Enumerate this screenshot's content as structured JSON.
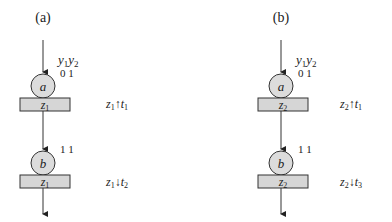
{
  "panels": [
    {
      "label": "(a)",
      "inputs": {
        "header_y1": "y",
        "header_sub1": "1",
        "header_y2": "y",
        "header_sub2": "2",
        "values_top": "0 1",
        "values_bottom": "1 1"
      },
      "nodes": [
        {
          "circle": "a",
          "box_var": "z",
          "box_sub": "1",
          "annotation": {
            "var": "z",
            "var_sub": "1",
            "arrow": "↑",
            "t": "t",
            "t_sub": "1"
          }
        },
        {
          "circle": "b",
          "box_var": "z",
          "box_sub": "1",
          "annotation": {
            "var": "z",
            "var_sub": "1",
            "arrow": "↓",
            "t": "t",
            "t_sub": "2"
          }
        }
      ]
    },
    {
      "label": "(b)",
      "inputs": {
        "header_y1": "y",
        "header_sub1": "1",
        "header_y2": "y",
        "header_sub2": "2",
        "values_top": "0 1",
        "values_bottom": "1 1"
      },
      "nodes": [
        {
          "circle": "a",
          "box_var": "z",
          "box_sub": "2",
          "annotation": {
            "var": "z",
            "var_sub": "2",
            "arrow": "↑",
            "t": "t",
            "t_sub": "1"
          }
        },
        {
          "circle": "b",
          "box_var": "z",
          "box_sub": "2",
          "annotation": {
            "var": "z",
            "var_sub": "2",
            "arrow": "↓",
            "t": "t",
            "t_sub": "3"
          }
        }
      ]
    }
  ],
  "colors": {
    "box_fill": "#d6d6d6",
    "circle_fill": "#dcdcdc",
    "stroke": "#333333"
  }
}
